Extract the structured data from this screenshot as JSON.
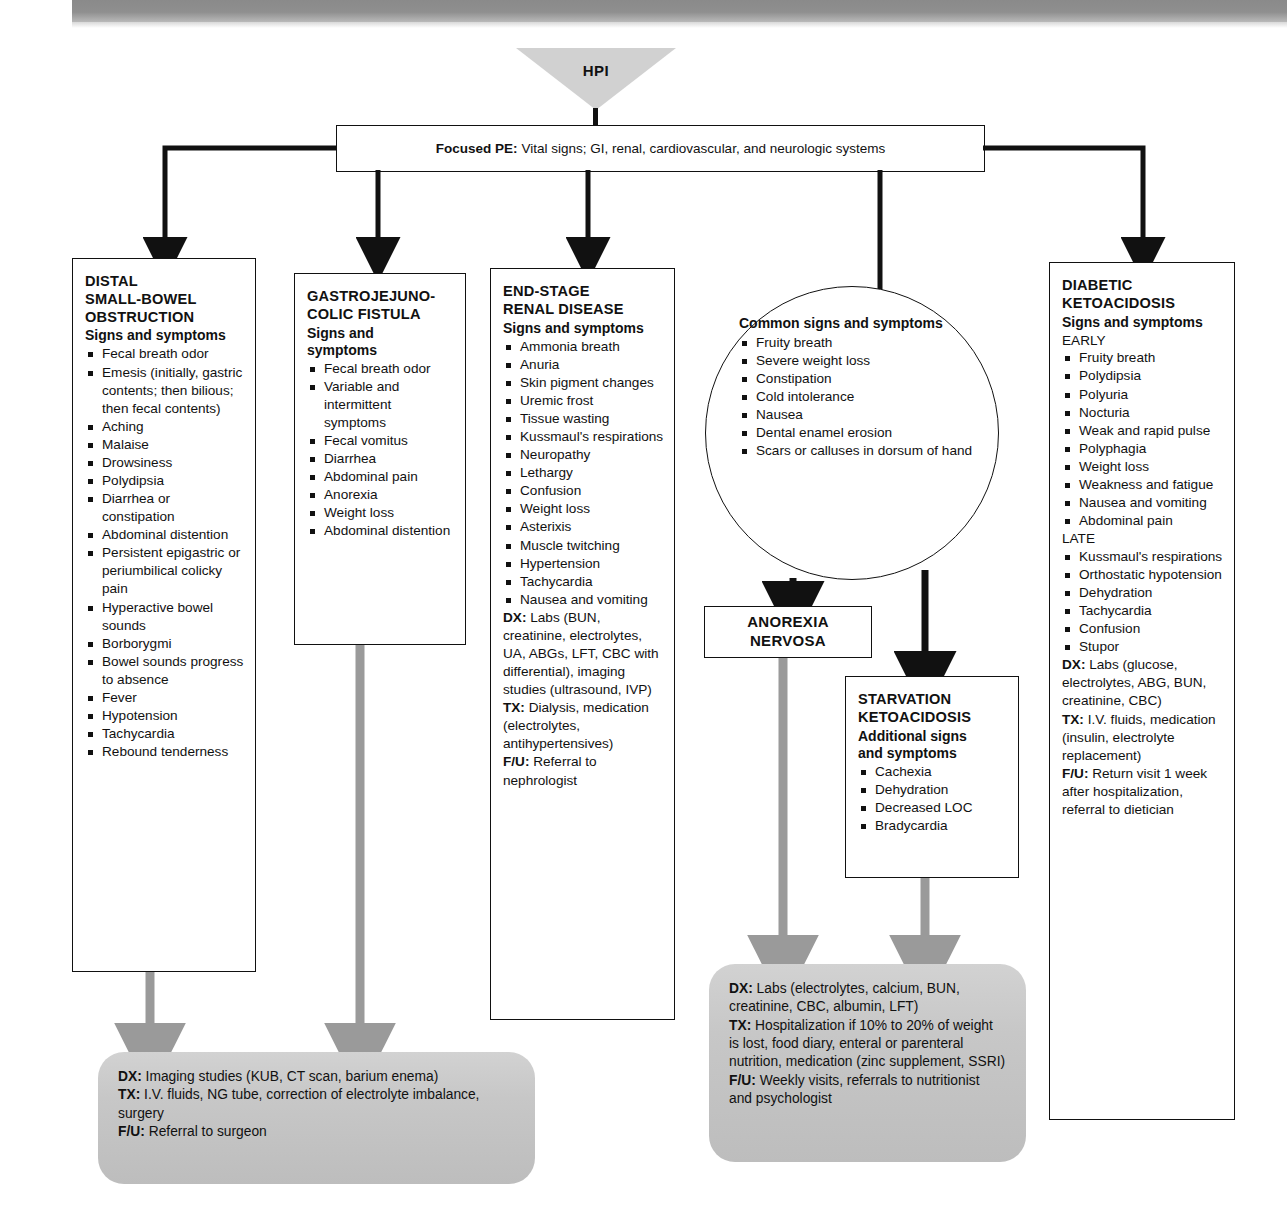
{
  "header": {
    "hpi_label": "HPI"
  },
  "focused_pe": {
    "label": "Focused PE:",
    "text": "Vital signs; GI, renal, cardiovascular, and neurologic systems"
  },
  "boxes": {
    "distal_sbo": {
      "title": "DISTAL\nSMALL-BOWEL\nOBSTRUCTION",
      "title_lines": [
        "DISTAL",
        "SMALL-BOWEL",
        "OBSTRUCTION"
      ],
      "subhead": "Signs and symptoms",
      "symptoms": [
        "Fecal breath odor",
        "Emesis (initially, gastric contents; then bilious; then fecal contents)",
        "Aching",
        "Malaise",
        "Drowsiness",
        "Polydipsia",
        "Diarrhea or constipation",
        "Abdominal distention",
        "Persistent epigastric or periumbilical colicky pain",
        "Hyperactive bowel sounds",
        "Borborygmi",
        "Bowel sounds progress to absence",
        "Fever",
        "Hypotension",
        "Tachycardia",
        "Rebound tenderness"
      ]
    },
    "gjc_fistula": {
      "title_lines": [
        "GASTROJEJUNO-",
        "COLIC FISTULA"
      ],
      "subhead_lines": [
        "Signs and",
        "symptoms"
      ],
      "symptoms": [
        "Fecal breath odor",
        "Variable and intermittent symptoms",
        "Fecal vomitus",
        "Diarrhea",
        "Abdominal pain",
        "Anorexia",
        "Weight loss",
        "Abdominal distention"
      ]
    },
    "esrd": {
      "title_lines": [
        "END-STAGE",
        "RENAL DISEASE"
      ],
      "subhead": "Signs and symptoms",
      "symptoms": [
        "Ammonia breath",
        "Anuria",
        "Skin pigment changes",
        "Uremic frost",
        "Tissue wasting",
        "Kussmaul's respirations",
        "Neuropathy",
        "Lethargy",
        "Confusion",
        "Weight loss",
        "Asterixis",
        "Muscle twitching",
        "Hypertension",
        "Tachycardia",
        "Nausea and vomiting"
      ],
      "dx_label": "DX:",
      "dx_text": "Labs (BUN, creatinine, electrolytes, UA, ABGs, LFT, CBC with differential), imaging studies (ultrasound, IVP)",
      "tx_label": "TX:",
      "tx_text": "Dialysis, medication (electrolytes, antihypertensives)",
      "fu_label": "F/U:",
      "fu_text": "Referral to nephrologist"
    },
    "common": {
      "header": "Common signs and symptoms",
      "symptoms": [
        "Fruity breath",
        "Severe weight loss",
        "Constipation",
        "Cold intolerance",
        "Nausea",
        "Dental enamel erosion",
        "Scars or calluses in dorsum of hand"
      ]
    },
    "anorexia": {
      "title_lines": [
        "ANOREXIA",
        "NERVOSA"
      ]
    },
    "starvation": {
      "title_lines": [
        "STARVATION",
        "KETOACIDOSIS"
      ],
      "subhead_lines": [
        "Additional signs",
        "and symptoms"
      ],
      "symptoms": [
        "Cachexia",
        "Dehydration",
        "Decreased LOC",
        "Bradycardia"
      ]
    },
    "dka": {
      "title_lines": [
        "DIABETIC",
        "KETOACIDOSIS"
      ],
      "subhead": "Signs and symptoms",
      "early_label": "EARLY",
      "early_symptoms": [
        "Fruity breath",
        "Polydipsia",
        "Polyuria",
        "Nocturia",
        "Weak and rapid pulse",
        "Polyphagia",
        "Weight loss",
        "Weakness and fatigue",
        "Nausea and vomiting",
        "Abdominal pain"
      ],
      "late_label": "LATE",
      "late_symptoms": [
        "Kussmaul's respirations",
        "Orthostatic hypotension",
        "Dehydration",
        "Tachycardia",
        "Confusion",
        "Stupor"
      ],
      "dx_label": "DX:",
      "dx_text": "Labs (glucose, electrolytes, ABG, BUN, creatinine, CBC)",
      "tx_label": "TX:",
      "tx_text": "I.V. fluids, medication (insulin, electrolyte replacement)",
      "fu_label": "F/U:",
      "fu_text": "Return visit 1 week after hospitalization, referral to dietician"
    }
  },
  "outcomes": {
    "left": {
      "dx_label": "DX:",
      "dx_text": "Imaging studies (KUB, CT scan, barium enema)",
      "tx_label": "TX:",
      "tx_text": "I.V. fluids, NG tube, correction of electrolyte imbalance, surgery",
      "fu_label": "F/U:",
      "fu_text": "Referral to surgeon"
    },
    "middle": {
      "dx_label": "DX:",
      "dx_text": "Labs (electrolytes, calcium, BUN, creatinine, CBC, albumin, LFT)",
      "tx_label": "TX:",
      "tx_text": "Hospitalization if 10% to 20% of weight is lost, food diary, enteral or parenteral nutrition, medication (zinc supplement, SSRI)",
      "fu_label": "F/U:",
      "fu_text": "Weekly visits, referrals to nutritionist and psychologist"
    }
  },
  "colors": {
    "line_black": "#111111",
    "arrow_gray": "#9a9a9a",
    "gray_box": "#c7c7c7",
    "banner_gray": "#8a8a8a"
  }
}
